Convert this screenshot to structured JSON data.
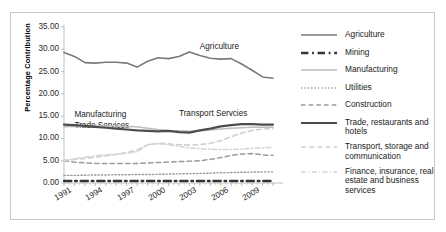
{
  "chart_data": {
    "type": "line",
    "title": "",
    "subtitle": "",
    "xlabel": "",
    "ylabel": "Percentage Contribution",
    "ylim": [
      0.0,
      35.0
    ],
    "ytick_step": 5.0,
    "ytick_labels": [
      "35.00",
      "30.00",
      "25.00",
      "20.00",
      "15.00",
      "10.00",
      "5.00",
      "0.00"
    ],
    "ytick_values": [
      35.0,
      30.0,
      25.0,
      20.0,
      15.0,
      10.0,
      5.0,
      0.0
    ],
    "xlim": [
      1991,
      2011
    ],
    "x": [
      1991,
      1992,
      1993,
      1994,
      1995,
      1996,
      1997,
      1998,
      1999,
      2000,
      2001,
      2002,
      2003,
      2004,
      2005,
      2006,
      2007,
      2008,
      2009,
      2010,
      2011
    ],
    "xtick_labels": [
      "1991",
      "1994",
      "1997",
      "2000",
      "2003",
      "2006",
      "2009"
    ],
    "xtick_values": [
      1991,
      1994,
      1997,
      2000,
      2003,
      2006,
      2009
    ],
    "grid": false,
    "legend_position": "right",
    "series": [
      {
        "name": "Agriculture",
        "color": "#7a7a7a",
        "style": "solid",
        "width": 1.6,
        "values": [
          29.3,
          28.4,
          27.0,
          26.9,
          27.1,
          27.1,
          26.9,
          26.0,
          27.3,
          28.1,
          27.9,
          28.4,
          29.4,
          28.6,
          28.0,
          27.8,
          27.9,
          26.7,
          25.3,
          23.8,
          23.5
        ]
      },
      {
        "name": "Mining",
        "color": "#333333",
        "style": "dash-dot",
        "width": 2.3,
        "values": [
          0.45,
          0.45,
          0.45,
          0.45,
          0.45,
          0.45,
          0.45,
          0.45,
          0.45,
          0.45,
          0.45,
          0.45,
          0.45,
          0.45,
          0.45,
          0.45,
          0.45,
          0.45,
          0.45,
          0.45,
          0.45
        ]
      },
      {
        "name": "Manufacturing",
        "color": "#bdbdbd",
        "style": "solid",
        "width": 1.5,
        "values": [
          12.6,
          12.7,
          12.7,
          12.8,
          12.8,
          12.8,
          12.7,
          12.6,
          12.3,
          12.0,
          11.8,
          11.7,
          11.6,
          11.7,
          11.9,
          12.1,
          12.3,
          12.4,
          12.5,
          12.5,
          12.5
        ]
      },
      {
        "name": "Utilities",
        "color": "#9a9a9a",
        "style": "dotted",
        "width": 1.4,
        "values": [
          1.7,
          1.7,
          1.75,
          1.8,
          1.8,
          1.85,
          1.85,
          1.9,
          1.9,
          1.95,
          2.0,
          2.05,
          2.1,
          2.15,
          2.2,
          2.3,
          2.35,
          2.4,
          2.45,
          2.5,
          2.5
        ]
      },
      {
        "name": "Construction",
        "color": "#9a9a9a",
        "style": "dashed",
        "width": 1.5,
        "values": [
          5.0,
          4.7,
          4.5,
          4.4,
          4.4,
          4.4,
          4.4,
          4.4,
          4.5,
          4.6,
          4.7,
          4.8,
          4.9,
          5.0,
          5.3,
          5.7,
          6.2,
          6.5,
          6.6,
          6.3,
          6.2
        ]
      },
      {
        "name": "Trade, restaurants and hotels",
        "color": "#4d4d4d",
        "style": "solid",
        "width": 2.2,
        "values": [
          13.1,
          13.0,
          12.8,
          12.6,
          12.4,
          12.2,
          12.0,
          11.8,
          11.7,
          11.6,
          11.7,
          11.4,
          11.3,
          11.8,
          12.2,
          12.7,
          13.0,
          13.2,
          13.2,
          13.1,
          13.1
        ]
      },
      {
        "name": "Transport, storage and communication",
        "color": "#cfcfcf",
        "style": "dashed",
        "width": 1.6,
        "values": [
          5.1,
          5.3,
          5.5,
          5.8,
          6.1,
          6.4,
          6.8,
          7.4,
          8.6,
          8.9,
          8.8,
          8.6,
          8.5,
          8.6,
          8.9,
          9.5,
          10.4,
          11.2,
          11.8,
          12.1,
          12.2
        ]
      },
      {
        "name": "Finance, insurance, real estate and business services",
        "color": "#d4d4d4",
        "style": "dash-dot",
        "width": 1.5,
        "values": [
          5.0,
          5.4,
          5.8,
          6.1,
          6.3,
          6.5,
          6.7,
          7.0,
          8.6,
          8.8,
          8.6,
          8.2,
          7.9,
          7.7,
          7.6,
          7.5,
          7.5,
          7.6,
          7.8,
          7.9,
          8.0
        ]
      }
    ],
    "annotations": [
      {
        "text": "Agriculture",
        "x": 2004,
        "y": 30.3
      },
      {
        "text": "Manufacturing",
        "x": 1992,
        "y": 15.0
      },
      {
        "text": "Trade Services",
        "x": 1992,
        "y": 12.5
      },
      {
        "text": "Transport Servcies",
        "x": 2002,
        "y": 15.2
      }
    ]
  },
  "legend": {
    "items": [
      {
        "label": "Agriculture",
        "series": "Agriculture"
      },
      {
        "label": "Mining",
        "series": "Mining"
      },
      {
        "label": "Manufacturing",
        "series": "Manufacturing"
      },
      {
        "label": "Utilities",
        "series": "Utilities"
      },
      {
        "label": "Construction",
        "series": "Construction"
      },
      {
        "label": "Trade, restaurants and hotels",
        "series": "Trade, restaurants and hotels"
      },
      {
        "label": "Transport, storage and communication",
        "series": "Transport, storage and communication"
      },
      {
        "label": "Finance, insurance, real estate and business services",
        "series": "Finance, insurance, real estate and business services"
      }
    ]
  },
  "colors": {
    "frame_border": "#c9c9c9",
    "axis": "#b8b8b8",
    "background": "#ffffff",
    "text": "#1a1a1a"
  }
}
